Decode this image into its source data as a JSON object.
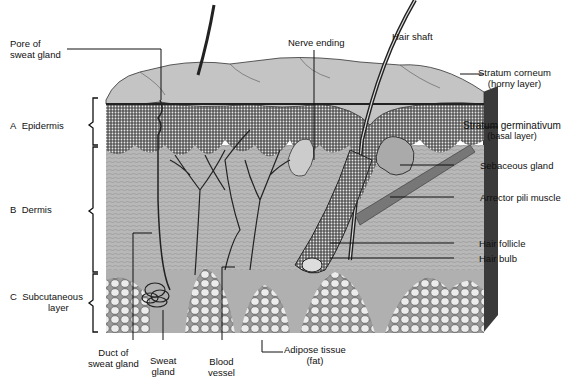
{
  "diagram": {
    "type": "anatomical cross-section"
  },
  "layers": [
    {
      "id": "A",
      "letter": "A",
      "name": "Epidermis"
    },
    {
      "id": "B",
      "letter": "B",
      "name": "Dermis"
    },
    {
      "id": "C",
      "letter": "C",
      "name": "Subcutaneous",
      "name2": "layer"
    }
  ],
  "labels": {
    "pore_line1": "Pore of",
    "pore_line2": "sweat gland",
    "nerve_ending": "Nerve ending",
    "hair_shaft": "Hair shaft",
    "stratum_corneum_line1": "Stratum corneum",
    "stratum_corneum_line2": "(horny layer)",
    "stratum_germ_line1": "Stratum germinativum",
    "stratum_germ_line2": "(basal layer)",
    "sebaceous_gland": "Sebaceous gland",
    "arrector_pili": "Arrector pili muscle",
    "hair_follicle": "Hair follicle",
    "hair_bulb": "Hair bulb",
    "duct_line1": "Duct of",
    "duct_line2": "sweat gland",
    "sweat_gland_line1": "Sweat",
    "sweat_gland_line2": "gland",
    "blood_vessel_line1": "Blood",
    "blood_vessel_line2": "vessel",
    "adipose_line1": "Adipose tissue",
    "adipose_line2": "(fat)"
  },
  "colors": {
    "ink": "#111111",
    "corneum": "#c8c8c8",
    "epidermis": "#6e6e6e",
    "dermis": "#b4b4b4",
    "fat": "#d8d8d8",
    "side": "#3a3a3a"
  }
}
